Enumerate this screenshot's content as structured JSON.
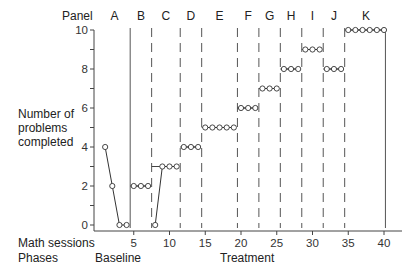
{
  "chart_data": {
    "type": "line",
    "title": "",
    "design": "changing criterion",
    "xlabel": "Math sessions",
    "ylabel": "Number of problems completed",
    "xlim": [
      0,
      42
    ],
    "ylim": [
      0,
      10
    ],
    "x_ticks": [
      5,
      10,
      15,
      20,
      25,
      30,
      35,
      40
    ],
    "y_ticks": [
      0,
      2,
      4,
      6,
      8,
      10
    ],
    "grid": false,
    "panel_row_label": "Panel",
    "phases_row_label": "Phases",
    "phases": [
      {
        "name": "Baseline",
        "sessions": [
          1,
          4
        ]
      },
      {
        "name": "Treatment",
        "sessions": [
          5,
          40
        ]
      }
    ],
    "panels": [
      {
        "label": "A",
        "start": 1,
        "end": 4,
        "criterion": null
      },
      {
        "label": "B",
        "start": 5,
        "end": 7,
        "criterion": 2
      },
      {
        "label": "C",
        "start": 8,
        "end": 11,
        "criterion": 3
      },
      {
        "label": "D",
        "start": 12,
        "end": 14,
        "criterion": 4
      },
      {
        "label": "E",
        "start": 15,
        "end": 19,
        "criterion": 5
      },
      {
        "label": "F",
        "start": 20,
        "end": 22,
        "criterion": 6
      },
      {
        "label": "G",
        "start": 23,
        "end": 25,
        "criterion": 7
      },
      {
        "label": "H",
        "start": 26,
        "end": 28,
        "criterion": 8
      },
      {
        "label": "I",
        "start": 29,
        "end": 31,
        "criterion": 9
      },
      {
        "label": "J",
        "start": 32,
        "end": 34,
        "criterion": 8
      },
      {
        "label": "K",
        "start": 35,
        "end": 40,
        "criterion": 10
      }
    ],
    "series": [
      {
        "name": "Problems completed",
        "x": [
          1,
          2,
          3,
          4,
          5,
          6,
          7,
          8,
          9,
          10,
          11,
          12,
          13,
          14,
          15,
          16,
          17,
          18,
          19,
          20,
          21,
          22,
          23,
          24,
          25,
          26,
          27,
          28,
          29,
          30,
          31,
          32,
          33,
          34,
          35,
          36,
          37,
          38,
          39,
          40
        ],
        "values": [
          4,
          2,
          0,
          0,
          2,
          2,
          2,
          0,
          3,
          3,
          3,
          4,
          4,
          4,
          5,
          5,
          5,
          5,
          5,
          6,
          6,
          6,
          7,
          7,
          7,
          8,
          8,
          8,
          9,
          9,
          9,
          8,
          8,
          8,
          10,
          10,
          10,
          10,
          10,
          10
        ]
      }
    ]
  },
  "labels": {
    "panel": "Panel",
    "ylabel_line1": "Number of",
    "ylabel_line2": "problems",
    "ylabel_line3": "completed",
    "xlabel": "Math sessions",
    "phases": "Phases",
    "baseline": "Baseline",
    "treatment": "Treatment"
  }
}
